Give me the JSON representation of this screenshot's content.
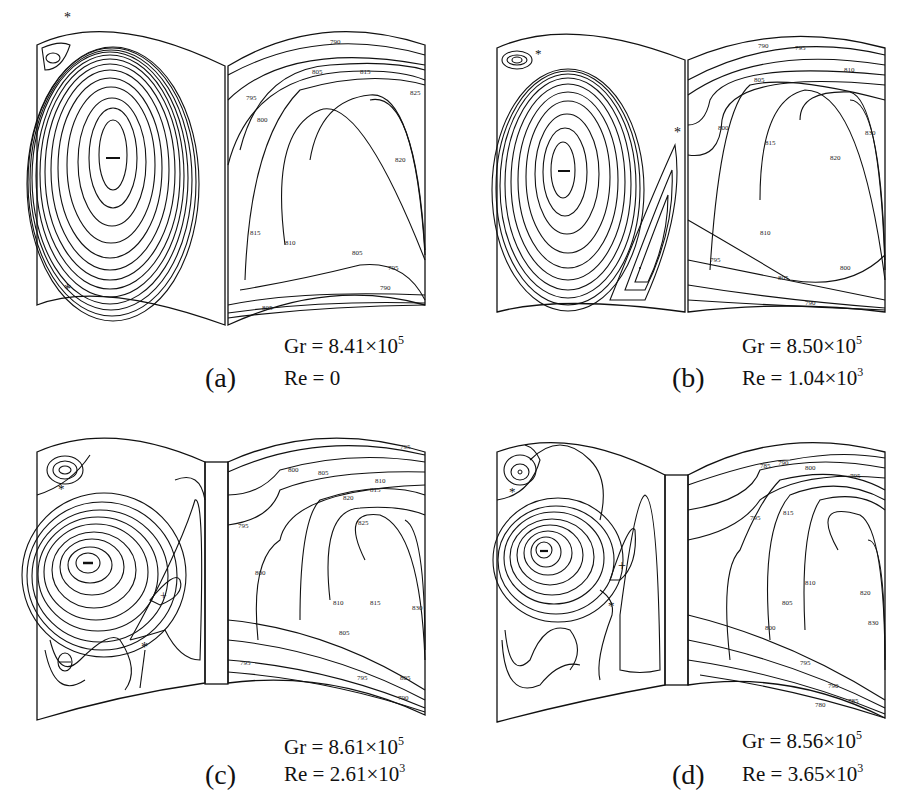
{
  "figure": {
    "panels": [
      {
        "id": "a",
        "label": "(a)",
        "gr_text": "Gr = 8.41×10",
        "gr_exp": "5",
        "re_text": "Re = 0",
        "re_exp": "",
        "streamline_markers": [
          "−",
          "*",
          "*"
        ],
        "isotherm_labels": [
          "790",
          "795",
          "800",
          "805",
          "810",
          "815",
          "820",
          "825",
          "795",
          "790",
          "805",
          "810",
          "815"
        ]
      },
      {
        "id": "b",
        "label": "(b)",
        "gr_text": "Gr = 8.50×10",
        "gr_exp": "5",
        "re_text": "Re = 1.04×10",
        "re_exp": "3",
        "streamline_markers": [
          "−",
          "*",
          "*",
          "·"
        ],
        "isotherm_labels": [
          "790",
          "795",
          "810",
          "805",
          "800",
          "815",
          "820",
          "830",
          "810",
          "795",
          "805",
          "800",
          "790"
        ]
      },
      {
        "id": "c",
        "label": "(c)",
        "gr_text": "Gr = 8.61×10",
        "gr_exp": "5",
        "re_text": "Re = 2.61×10",
        "re_exp": "3",
        "streamline_markers": [
          "−",
          "+",
          "*",
          "*",
          "θ"
        ],
        "isotherm_labels": [
          "795",
          "800",
          "805",
          "795",
          "800",
          "810",
          "815",
          "820",
          "825",
          "810",
          "815",
          "805",
          "795",
          "795",
          "805",
          "790",
          "830"
        ]
      },
      {
        "id": "d",
        "label": "(d)",
        "gr_text": "Gr = 8.56×10",
        "gr_exp": "5",
        "re_text": "Re = 3.65×10",
        "re_exp": "3",
        "streamline_markers": [
          "−",
          "+",
          "*",
          "*"
        ],
        "isotherm_labels": [
          "785",
          "790",
          "800",
          "795",
          "815",
          "795",
          "810",
          "805",
          "800",
          "820",
          "830",
          "795",
          "790",
          "785",
          "780"
        ]
      }
    ]
  },
  "colors": {
    "ink": "#111111",
    "background": "#ffffff"
  }
}
